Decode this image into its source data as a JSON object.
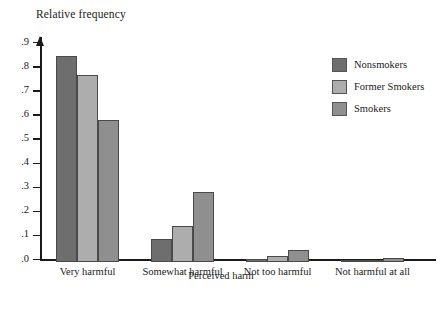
{
  "chart_data": {
    "type": "bar",
    "title": "",
    "ylabel": "Relative frequency",
    "xlabel": "Perceived harm",
    "grid": false,
    "legend_position": "top-right",
    "ylim": [
      0,
      0.95
    ],
    "ytick_labels": [
      ".0",
      ".1",
      ".2",
      ".3",
      ".4",
      ".5",
      ".6",
      ".7",
      ".8",
      ".9"
    ],
    "ytick_values": [
      0,
      0.1,
      0.2,
      0.3,
      0.4,
      0.5,
      0.6,
      0.7,
      0.8,
      0.9
    ],
    "categories": [
      "Very harmful",
      "Somewhat harmful",
      "Not too harmful",
      "Not harmful at all"
    ],
    "series": [
      {
        "name": "Nonsmokers",
        "color": "#6e6e6e",
        "values": [
          0.855,
          0.095,
          0.013,
          0.005
        ]
      },
      {
        "name": "Former Smokers",
        "color": "#adadad",
        "values": [
          0.775,
          0.15,
          0.025,
          0.008
        ]
      },
      {
        "name": "Smokers",
        "color": "#8f8f8f",
        "values": [
          0.59,
          0.29,
          0.05,
          0.015
        ]
      }
    ]
  },
  "legend": {
    "items": [
      {
        "label": "Nonsmokers",
        "color": "#6e6e6e"
      },
      {
        "label": "Former Smokers",
        "color": "#adadad"
      },
      {
        "label": "Smokers",
        "color": "#8f8f8f"
      }
    ]
  }
}
